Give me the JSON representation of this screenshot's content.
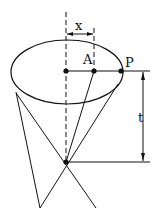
{
  "diagram": {
    "labels": {
      "x": "x",
      "A": "A",
      "P": "P",
      "t": "t"
    },
    "colors": {
      "stroke": "#111111",
      "background": "#ffffff"
    }
  }
}
